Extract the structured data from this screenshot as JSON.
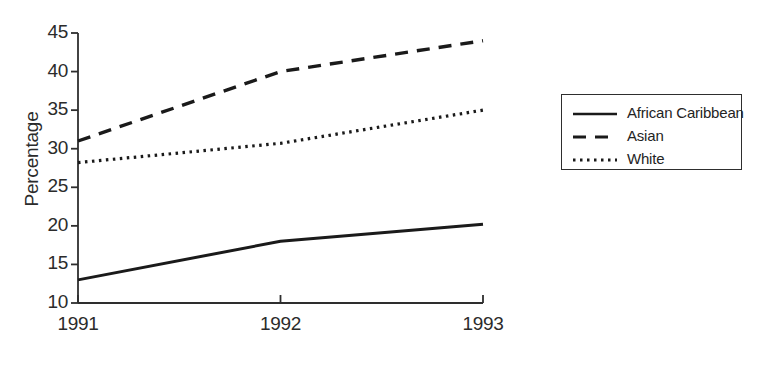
{
  "chart_data": {
    "type": "line",
    "title": "",
    "subtitle": "",
    "xlabel": "",
    "ylabel": "Percentage",
    "x": [
      1991,
      1992,
      1993
    ],
    "categories": [
      "1991",
      "1992",
      "1993"
    ],
    "xtick_labels": [
      "1991",
      "1992",
      "1993"
    ],
    "ytick_labels": [
      "10",
      "15",
      "20",
      "25",
      "30",
      "35",
      "40",
      "45"
    ],
    "ytick_values": [
      10,
      15,
      20,
      25,
      30,
      35,
      40,
      45
    ],
    "ylim": [
      10,
      45
    ],
    "xlim": [
      1991,
      1993
    ],
    "grid": false,
    "legend_position": "right",
    "series": [
      {
        "name": "African Caribbean",
        "style": "solid",
        "color": "#1a1a1a",
        "values": [
          13.0,
          18.0,
          20.2
        ]
      },
      {
        "name": "Asian",
        "style": "dashed",
        "color": "#1a1a1a",
        "values": [
          31.0,
          40.0,
          44.0
        ]
      },
      {
        "name": "White",
        "style": "dotted",
        "color": "#1a1a1a",
        "values": [
          28.2,
          30.7,
          35.0
        ]
      }
    ]
  },
  "axes": {
    "y_label": "Percentage",
    "y_ticks": [
      {
        "label": "45",
        "value": 45
      },
      {
        "label": "40",
        "value": 40
      },
      {
        "label": "35",
        "value": 35
      },
      {
        "label": "30",
        "value": 30
      },
      {
        "label": "25",
        "value": 25
      },
      {
        "label": "20",
        "value": 20
      },
      {
        "label": "15",
        "value": 15
      },
      {
        "label": "10",
        "value": 10
      }
    ],
    "x_ticks": [
      {
        "label": "1991",
        "value": 1991
      },
      {
        "label": "1992",
        "value": 1992
      },
      {
        "label": "1993",
        "value": 1993
      }
    ],
    "axis_color": "#2e2e2e"
  },
  "legend": {
    "entries": [
      {
        "label": "African Caribbean",
        "style": "solid"
      },
      {
        "label": "Asian",
        "style": "dashed"
      },
      {
        "label": "White",
        "style": "dotted"
      }
    ]
  }
}
